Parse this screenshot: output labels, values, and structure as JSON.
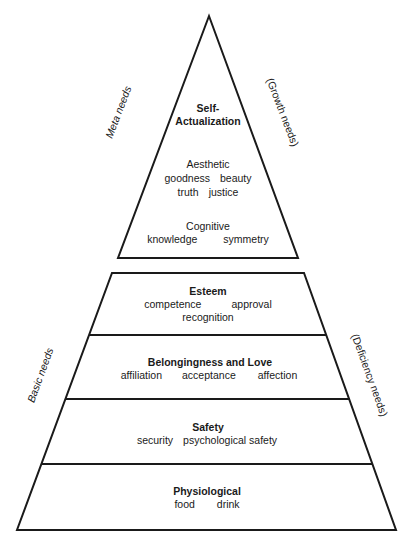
{
  "diagram": {
    "type": "pyramid",
    "stroke_color": "#1a1a1a",
    "background": "#ffffff"
  },
  "top_triangle": {
    "side_left": "Meta needs",
    "side_right": "(Growth needs)",
    "title_line1": "Self-",
    "title_line2": "Actualization",
    "groups": [
      {
        "heading": "Aesthetic",
        "rows": [
          [
            "goodness",
            "beauty"
          ],
          [
            "truth",
            "justice"
          ]
        ]
      },
      {
        "heading": "Cognitive",
        "rows": [
          [
            "knowledge",
            "symmetry"
          ]
        ]
      }
    ]
  },
  "bottom_trapezoid": {
    "side_left": "Basic needs",
    "side_right": "(Deficiency needs)",
    "levels": [
      {
        "title": "Esteem",
        "items_row1": [
          "competence",
          "approval"
        ],
        "items_row2": [
          "recognition"
        ]
      },
      {
        "title": "Belongingness and Love",
        "items_row1": [
          "affiliation",
          "acceptance",
          "affection"
        ]
      },
      {
        "title": "Safety",
        "items_row1": [
          "security",
          "psychological safety"
        ]
      },
      {
        "title": "Physiological",
        "items_row1": [
          "food",
          "drink"
        ]
      }
    ]
  }
}
